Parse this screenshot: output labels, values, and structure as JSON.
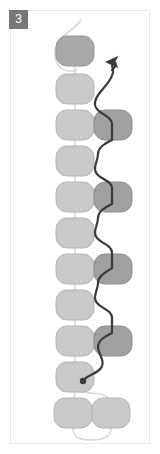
{
  "panel": {
    "badge_label": "3",
    "title": "Panel 3 diagram",
    "background_color": "#ffffff",
    "frame_color": "#e9e9e9",
    "badge_color": "#777777",
    "badge_text_color": "#ffffff"
  },
  "palette": {
    "node_light_fill": "#c9c9c9",
    "node_light_stroke": "#b4b4b4",
    "node_dark_fill": "#a0a0a0",
    "node_dark_stroke": "#8d8d8d",
    "node_top_fill": "#a8a8a8",
    "node_top_stroke": "#959595",
    "light_edge_color": "#d8d8d8",
    "dark_path_color": "#3a3a3a"
  },
  "geometry": {
    "node_width": 38,
    "node_height": 30,
    "node_radius": 11,
    "left_column_x": 75,
    "right_column_x": 113,
    "rows_y": [
      51,
      89,
      125,
      161,
      197,
      233,
      269,
      305,
      341,
      377,
      413
    ],
    "bottom_pair_left_x": 73,
    "bottom_pair_right_x": 111
  },
  "nodes": [
    {
      "id": "n1",
      "label": "node-1",
      "column": "left",
      "row": 0,
      "cx": 75,
      "cy": 51,
      "shade": "top"
    },
    {
      "id": "n2",
      "label": "node-2",
      "column": "left",
      "row": 1,
      "cx": 75,
      "cy": 89,
      "shade": "light"
    },
    {
      "id": "n3",
      "label": "node-3",
      "column": "left",
      "row": 2,
      "cx": 75,
      "cy": 125,
      "shade": "light"
    },
    {
      "id": "n4",
      "label": "node-4",
      "column": "left",
      "row": 3,
      "cx": 75,
      "cy": 161,
      "shade": "light"
    },
    {
      "id": "n5",
      "label": "node-5",
      "column": "left",
      "row": 4,
      "cx": 75,
      "cy": 197,
      "shade": "light"
    },
    {
      "id": "n6",
      "label": "node-6",
      "column": "left",
      "row": 5,
      "cx": 75,
      "cy": 233,
      "shade": "light"
    },
    {
      "id": "n7",
      "label": "node-7",
      "column": "left",
      "row": 6,
      "cx": 75,
      "cy": 269,
      "shade": "light"
    },
    {
      "id": "n8",
      "label": "node-8",
      "column": "left",
      "row": 7,
      "cx": 75,
      "cy": 305,
      "shade": "light"
    },
    {
      "id": "n9",
      "label": "node-9",
      "column": "left",
      "row": 8,
      "cx": 75,
      "cy": 341,
      "shade": "light"
    },
    {
      "id": "n10",
      "label": "node-10",
      "column": "left",
      "row": 9,
      "cx": 75,
      "cy": 377,
      "shade": "light"
    },
    {
      "id": "n11",
      "label": "node-11",
      "column": "left",
      "row": 10,
      "cx": 73,
      "cy": 413,
      "shade": "light"
    },
    {
      "id": "r1",
      "label": "branch-node-1",
      "column": "right",
      "row": 2,
      "cx": 113,
      "cy": 125,
      "shade": "dark"
    },
    {
      "id": "r2",
      "label": "branch-node-2",
      "column": "right",
      "row": 4,
      "cx": 113,
      "cy": 197,
      "shade": "dark"
    },
    {
      "id": "r3",
      "label": "branch-node-3",
      "column": "right",
      "row": 6,
      "cx": 113,
      "cy": 269,
      "shade": "dark"
    },
    {
      "id": "r4",
      "label": "branch-node-4",
      "column": "right",
      "row": 8,
      "cx": 113,
      "cy": 341,
      "shade": "dark"
    },
    {
      "id": "r5",
      "label": "branch-node-5",
      "column": "right",
      "row": 10,
      "cx": 111,
      "cy": 413,
      "shade": "light"
    }
  ],
  "light_edges": [
    {
      "id": "e-top-loop",
      "label": "top-loop-edge",
      "d": "M 81 20 C 74 30 64 33 59 41 C 53 50 54 60 59 66 C 64 72 72 72 77 70"
    },
    {
      "id": "e-1-2",
      "label": "edge-1-2",
      "d": "M 75 66 L 75 74"
    },
    {
      "id": "e-2-3",
      "label": "edge-2-3",
      "d": "M 75 104 L 75 110"
    },
    {
      "id": "e-3-4",
      "label": "edge-3-4",
      "d": "M 75 140 L 75 146"
    },
    {
      "id": "e-4-5",
      "label": "edge-4-5",
      "d": "M 75 176 L 75 182"
    },
    {
      "id": "e-5-6",
      "label": "edge-5-6",
      "d": "M 75 212 L 75 218"
    },
    {
      "id": "e-6-7",
      "label": "edge-6-7",
      "d": "M 75 248 L 75 254"
    },
    {
      "id": "e-7-8",
      "label": "edge-7-8",
      "d": "M 75 284 L 75 290"
    },
    {
      "id": "e-8-9",
      "label": "edge-8-9",
      "d": "M 75 320 L 75 326"
    },
    {
      "id": "e-9-10",
      "label": "edge-9-10",
      "d": "M 75 356 L 75 362"
    },
    {
      "id": "e-10-11",
      "label": "edge-10-11",
      "d": "M 75 392 C 75 398 73 398 73 398"
    },
    {
      "id": "e-10-r5",
      "label": "edge-10-branch-5",
      "d": "M 80 392 C 92 394 104 392 108 398"
    },
    {
      "id": "e-bottom-loop",
      "label": "bottom-loop-edge",
      "d": "M 73 428 C 73 438 80 440 92 440 C 104 440 111 437 111 428"
    }
  ],
  "dark_path": {
    "id": "main-path",
    "label": "highlighted-traversal-path",
    "d": "M 83 381 C 87 374 96 375 101 368 C 106 361 98 354 98 347 C 98 340 106 336 112 333 L 112 318 C 112 310 102 309 97 303 C 92 297 98 290 98 283 C 98 276 106 272 112 268 L 112 253 C 112 245 102 244 97 238 C 92 232 98 225 98 218 C 98 211 106 207 112 204 L 112 188 C 112 181 102 180 97 174 C 92 168 98 161 98 154 C 98 147 106 143 112 140 L 112 124 C 112 117 102 115 97 109 C 92 103 97 96 102 90 C 108 83 116 74 112 66",
    "marker_dot": {
      "cx": 83,
      "cy": 381,
      "r": 3.2,
      "label": "path-start-dot"
    },
    "arrow_tip": {
      "x": 112,
      "y": 62,
      "label": "path-end-arrowhead"
    }
  },
  "accessibility": {
    "figure_caption": "Panel 3: vertical chain of rounded nodes with branch nodes on the right and a highlighted zig-zag traversal path ending in an arrow"
  }
}
